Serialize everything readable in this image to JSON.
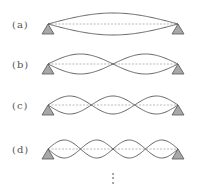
{
  "diagram": {
    "rows": [
      {
        "label": "(a)",
        "loops": 1,
        "y": 24,
        "amplitude": 11
      },
      {
        "label": "(b)",
        "loops": 2,
        "y": 64,
        "amplitude": 10
      },
      {
        "label": "(c)",
        "loops": 3,
        "y": 105,
        "amplitude": 9
      },
      {
        "label": "(d)",
        "loops": 4,
        "y": 149,
        "amplitude": 9
      }
    ],
    "x_start": 48,
    "x_end": 178,
    "continuation": "⋮",
    "colors": {
      "wave": "#555555",
      "axis_dashed": "#aaaaaa",
      "support_fill": "#a8a8a8",
      "support_stroke": "#555555",
      "label": "#555555"
    }
  }
}
